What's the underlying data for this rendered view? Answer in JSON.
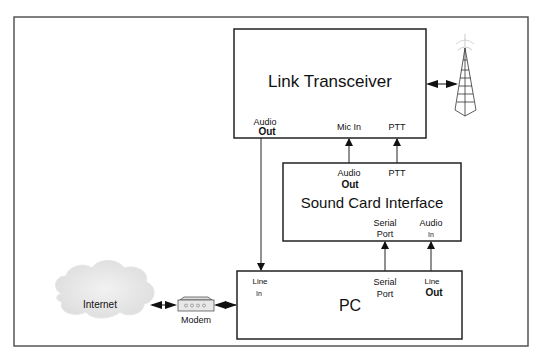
{
  "diagram": {
    "blocks": {
      "link_transceiver": {
        "title": "Link Transceiver",
        "ports": {
          "audio_out_line1": "Audio",
          "audio_out_line2": "Out",
          "mic_in": "Mic In",
          "ptt": "PTT"
        }
      },
      "sound_card_interface": {
        "title": "Sound Card Interface",
        "ports": {
          "audio_out_line1": "Audio",
          "audio_out_line2": "Out",
          "ptt": "PTT",
          "serial_port_line1": "Serial",
          "serial_port_line2": "Port",
          "audio_in_line1": "Audio",
          "audio_in_line2": "In"
        }
      },
      "pc": {
        "title": "PC",
        "ports": {
          "line_in_line1": "Line",
          "line_in_line2": "In",
          "serial_port_line1": "Serial",
          "serial_port_line2": "Port",
          "line_out_line1": "Line",
          "line_out_line2": "Out"
        }
      }
    },
    "internet_label": "Internet",
    "modem_label": "Modem",
    "antenna": "radio-tower-icon"
  }
}
